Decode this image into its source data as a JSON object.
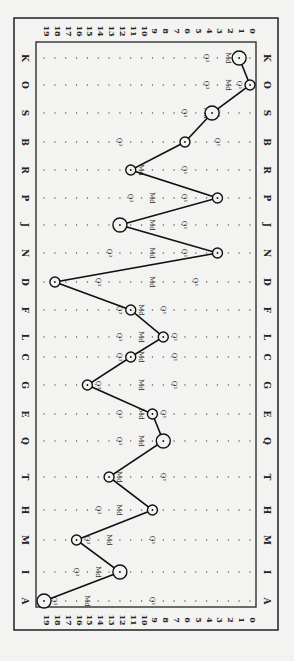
{
  "chart_data": {
    "type": "line",
    "orientation": "rotated-90-clockwise",
    "title": "",
    "xlabel": "",
    "ylabel": "",
    "scale": {
      "min": 0,
      "max": 19,
      "ticks": [
        19,
        18,
        17,
        16,
        15,
        14,
        13,
        12,
        11,
        10,
        9,
        8,
        7,
        6,
        5,
        4,
        3,
        2,
        1,
        0
      ]
    },
    "categories": [
      "K",
      "O",
      "S",
      "B",
      "R",
      "P",
      "J",
      "N",
      "D",
      "F",
      "L",
      "C",
      "G",
      "E",
      "Q",
      "T",
      "H",
      "M",
      "I",
      "A"
    ],
    "series": [
      {
        "name": "Profile (circled values)",
        "values": [
          1,
          0,
          3.5,
          6,
          11,
          3,
          12,
          3,
          18,
          11,
          8,
          11,
          15,
          9,
          8,
          13,
          9,
          16,
          12,
          19
        ]
      }
    ],
    "annotations": {
      "K": {
        "Q1": 1,
        "Md": 2,
        "Q3": 4
      },
      "O": {
        "Q1": 1,
        "Md": 2,
        "Q3": 4
      },
      "S": {
        "Q1": 3,
        "Md": 4,
        "Q3": 6
      },
      "B": {
        "Q1": 3,
        "Md": 6,
        "Q3": 12
      },
      "R": {
        "Q1": 6,
        "Md": 10,
        "Q3": 11
      },
      "P": {
        "Q1": 6,
        "Md": 9,
        "Q3": 11
      },
      "J": {
        "Q1": 6,
        "Md": 9,
        "Q3": 12
      },
      "N": {
        "Q1": 6,
        "Md": 9,
        "Q3": 13
      },
      "D": {
        "Q1": 5,
        "Md": 9,
        "Q3": 14
      },
      "F": {
        "Q1": 8,
        "Md": 10,
        "Q3": 12
      },
      "L": {
        "Q1": 7,
        "Md": 10,
        "Q3": 12
      },
      "C": {
        "Q1": 7,
        "Md": 10,
        "Q3": 12
      },
      "G": {
        "Q1": 7,
        "Md": 10,
        "Q3": 14
      },
      "E": {
        "Q1": 8,
        "Md": 10,
        "Q3": 12
      },
      "Q": {
        "Q1": 8,
        "Md": 10,
        "Q3": 12
      },
      "T": {
        "Q1": 8,
        "Md": 12,
        "Q3": 13
      },
      "H": {
        "Q1": 9,
        "Md": 12,
        "Q3": 14
      },
      "M": {
        "Q1": 9,
        "Md": 13,
        "Q3": 15
      },
      "I": {
        "Q1": 12,
        "Md": 14,
        "Q3": 16
      },
      "A": {
        "Q1": 9,
        "Md": 15,
        "Q3": 18
      }
    },
    "large_circles": [
      "K",
      "S",
      "Q",
      "J",
      "I",
      "A"
    ],
    "grid": "dotted",
    "legend": "none"
  },
  "labels": {
    "q1": "Q¹",
    "md": "Md",
    "q3": "Q³"
  }
}
